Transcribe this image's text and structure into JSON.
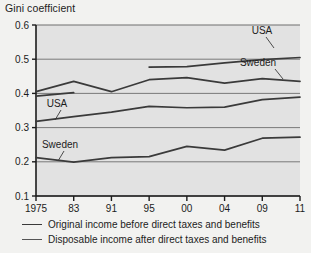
{
  "title": "Gini coefficient",
  "legend": {
    "items": [
      {
        "label": "Original income before direct taxes and benefits",
        "color": "#3a3a3a",
        "width": 1.9
      },
      {
        "label": "Disposable income after direct taxes and benefits",
        "color": "#555555",
        "width": 1.4
      }
    ]
  },
  "annotations": [
    {
      "name": "usa-disposable-label",
      "text": "USA",
      "x": 262,
      "y": 34
    },
    {
      "name": "sweden-original-label",
      "text": "Sweden",
      "x": 258,
      "y": 66
    },
    {
      "name": "usa-original-label",
      "text": "USA",
      "x": 57,
      "y": 107
    },
    {
      "name": "sweden-disposable-label",
      "text": "Sweden",
      "x": 60,
      "y": 148
    }
  ],
  "leaders": [
    {
      "name": "usa-disposable-leader",
      "x1": 266,
      "y1": 37,
      "x2": 274,
      "y2": 48
    },
    {
      "name": "sweden-original-leader",
      "x1": 275,
      "y1": 69,
      "x2": 283,
      "y2": 79
    },
    {
      "name": "usa-original-leader",
      "x1": 61,
      "y1": 110,
      "x2": 55,
      "y2": 120
    },
    {
      "name": "sweden-disposable-leader",
      "x1": 64,
      "y1": 151,
      "x2": 58,
      "y2": 161
    }
  ],
  "chart_data": {
    "type": "line",
    "title": "Gini coefficient",
    "xlabel": "",
    "ylabel": "Gini coefficient",
    "ylim": [
      0.1,
      0.6
    ],
    "yticks": [
      0.1,
      0.2,
      0.3,
      0.4,
      0.5,
      0.6
    ],
    "ytick_labels": [
      "0.1",
      "0.2",
      "0.3",
      "0.4",
      "0.5",
      "0.6"
    ],
    "categories": [
      "1975",
      "83",
      "91",
      "95",
      "00",
      "04",
      "09",
      "11"
    ],
    "xtick_labels": [
      "1975",
      "83",
      "91",
      "95",
      "00",
      "04",
      "09",
      "11"
    ],
    "grid": true,
    "legend_position": "below",
    "series": [
      {
        "name": "USA - Disposable income after direct taxes and benefits",
        "country": "USA",
        "measure": "disposable",
        "color": "#3a3a3a",
        "width": 1.7,
        "x": [
          "95",
          "00",
          "04",
          "09",
          "11"
        ],
        "values": [
          0.477,
          0.478,
          0.489,
          0.499,
          0.505
        ]
      },
      {
        "name": "Sweden - Original income before direct taxes and benefits",
        "country": "Sweden",
        "measure": "original",
        "color": "#3a3a3a",
        "width": 1.7,
        "x": [
          "1975",
          "83",
          "91",
          "95",
          "00",
          "04",
          "09",
          "11"
        ],
        "values": [
          0.405,
          0.435,
          0.405,
          0.44,
          0.446,
          0.43,
          0.443,
          0.435
        ]
      },
      {
        "name": "USA - Original income before direct taxes and benefits",
        "country": "USA",
        "measure": "original",
        "color": "#3a3a3a",
        "width": 1.7,
        "x": [
          "1975",
          "83",
          "91",
          "95",
          "00",
          "04",
          "09",
          "11"
        ],
        "values": [
          0.318,
          0.332,
          0.345,
          0.362,
          0.358,
          0.36,
          0.382,
          0.389
        ]
      },
      {
        "name": "Sweden - Disposable income after direct taxes and benefits",
        "country": "Sweden",
        "measure": "disposable",
        "color": "#3a3a3a",
        "width": 1.7,
        "x": [
          "1975",
          "83",
          "91",
          "95",
          "00",
          "04",
          "09",
          "11"
        ],
        "values": [
          0.212,
          0.199,
          0.212,
          0.215,
          0.245,
          0.234,
          0.269,
          0.272
        ]
      },
      {
        "name": "Sweden - early flat segment (1975-83)",
        "country": "Sweden",
        "measure": "original-early",
        "color": "#3a3a3a",
        "width": 1.7,
        "x": [
          "1975",
          "83"
        ],
        "values": [
          0.392,
          0.402
        ]
      }
    ]
  },
  "plot": {
    "bg": "#e2e2e2",
    "grid_color": "#6e6e6e",
    "axis_color": "#1c1c1c",
    "left": 36,
    "right": 300,
    "top": 25,
    "bottom": 196
  }
}
